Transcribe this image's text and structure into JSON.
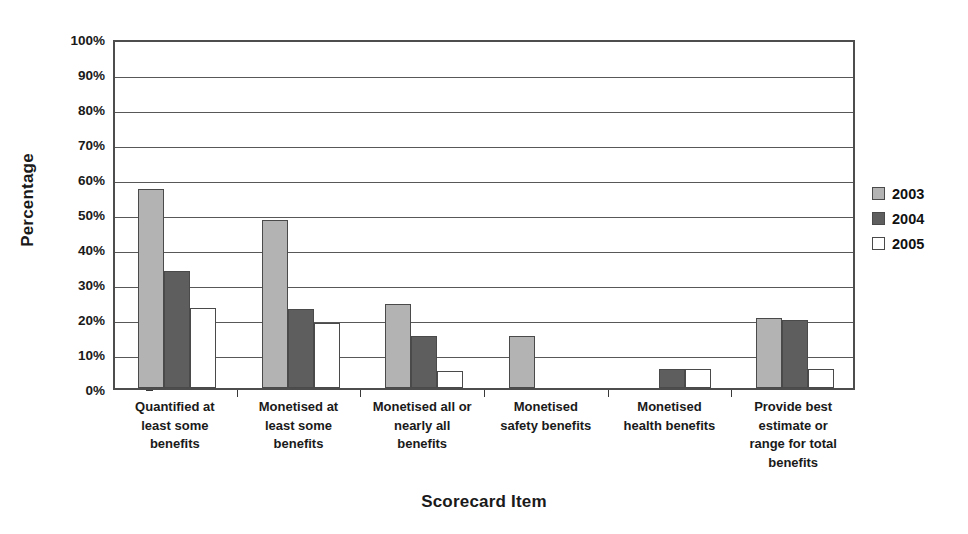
{
  "chart_data": {
    "type": "bar",
    "title": "",
    "xlabel": "Scorecard Item",
    "ylabel": "Percentage",
    "ylim": [
      0,
      100
    ],
    "y_unit": "%",
    "grid": true,
    "legend_position": "right",
    "y_ticks": [
      "0%",
      "10%",
      "20%",
      "30%",
      "40%",
      "50%",
      "60%",
      "70%",
      "80%",
      "90%",
      "100%"
    ],
    "y_tick_values": [
      0,
      10,
      20,
      30,
      40,
      50,
      60,
      70,
      80,
      90,
      100
    ],
    "categories": [
      "Quantified at least some benefits",
      "Monetised at least some benefits",
      "Monetised all or nearly all benefits",
      "Monetised safety benefits",
      "Monetised health benefits",
      "Provide best estimate or range for total benefits"
    ],
    "category_lines": [
      [
        "Quantified at",
        "least some",
        "benefits"
      ],
      [
        "Monetised at",
        "least some",
        "benefits"
      ],
      [
        "Monetised all or",
        "nearly all",
        "benefits"
      ],
      [
        "Monetised",
        "safety benefits"
      ],
      [
        "Monetised",
        "health benefits"
      ],
      [
        "Provide best",
        "estimate or",
        "range for total",
        "benefits"
      ]
    ],
    "series": [
      {
        "name": "2003",
        "color": "#b3b3b3",
        "values": [
          57,
          48,
          24,
          15,
          0,
          20
        ]
      },
      {
        "name": "2004",
        "color": "#5e5e5e",
        "values": [
          33.5,
          22.5,
          15,
          0,
          5.5,
          19.5
        ]
      },
      {
        "name": "2005",
        "color": "#ffffff",
        "values": [
          23,
          18.5,
          5,
          0,
          5.5,
          5.5
        ]
      }
    ]
  },
  "legend": {
    "items": [
      {
        "label": "2003",
        "swatch_class": "s2003"
      },
      {
        "label": "2004",
        "swatch_class": "s2004"
      },
      {
        "label": "2005",
        "swatch_class": "s2005"
      }
    ]
  },
  "axes": {
    "y_title": "Percentage",
    "x_title": "Scorecard Item"
  }
}
